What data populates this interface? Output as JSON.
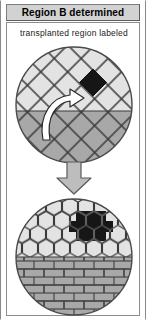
{
  "panel": {
    "title": "Region B determined",
    "caption": "transplanted region labeled"
  },
  "colors": {
    "title_bar_bg": "#d2d2d2",
    "frame_border": "#8d8d8d",
    "tile_light": "#e3e3e3",
    "tile_dark": "#a8a8a8",
    "tile_marked": "#161616",
    "outline": "#3a3a3a",
    "arrow_fill": "#bdbdbd",
    "arrow_outline": "#5a5a5a",
    "curved_arrow_fill": "#ffffff",
    "curved_arrow_outline": "#2b2b2b"
  },
  "figures": {
    "top": {
      "name": "donor-host-disc-diamond-grid",
      "shape": "circle",
      "diameter": 120,
      "pattern": "diamond-lattice",
      "regions": [
        {
          "label": "upper-light-region",
          "fill": "#e3e3e3"
        },
        {
          "label": "lower-dark-region",
          "fill": "#a8a8a8"
        }
      ],
      "marked_cell": {
        "label": "transplanted-cell",
        "fill": "#161616"
      },
      "annotation": {
        "label": "transplant-curved-arrow",
        "direction": "up-right"
      }
    },
    "bottom": {
      "name": "result-disc-hex-brick",
      "shape": "circle",
      "diameter": 120,
      "regions": [
        {
          "label": "hexagon-region",
          "pattern": "hexagon",
          "fill": "#e3e3e3"
        },
        {
          "label": "brick-region",
          "pattern": "brick",
          "fill": "#a8a8a8"
        }
      ],
      "marked_cell": {
        "label": "labeled-region-b",
        "fill": "#161616",
        "pattern": "hexagon-cluster"
      }
    },
    "transfer": {
      "name": "downward-step-arrow",
      "direction": "down"
    }
  }
}
